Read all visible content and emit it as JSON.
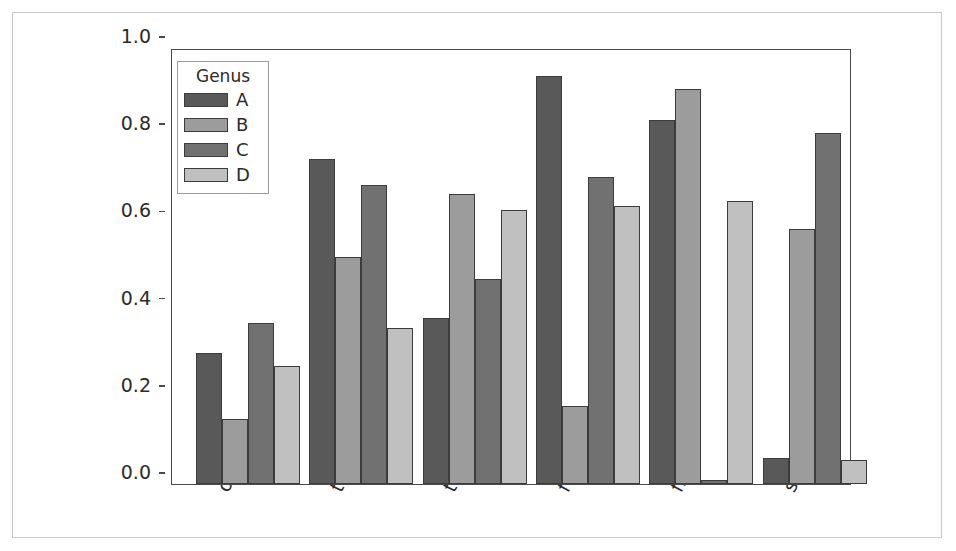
{
  "chart_data": {
    "type": "bar",
    "title": "",
    "xlabel": "",
    "ylabel": "",
    "categories": [
      "one",
      "two",
      "three",
      "four",
      "five",
      "six"
    ],
    "ylim": [
      0.0,
      1.0
    ],
    "yticks": [
      "0.0",
      "0.2",
      "0.4",
      "0.6",
      "0.8",
      "1.0"
    ],
    "ytick_values": [
      0.0,
      0.2,
      0.4,
      0.6,
      0.8,
      1.0
    ],
    "grid": false,
    "legend_title": "Genus",
    "legend_position": "upper-left-inside",
    "series": [
      {
        "name": "A",
        "color": "#595959",
        "values": [
          0.3,
          0.745,
          0.38,
          0.935,
          0.835,
          0.06
        ]
      },
      {
        "name": "B",
        "color": "#9c9c9c",
        "values": [
          0.15,
          0.52,
          0.665,
          0.18,
          0.905,
          0.585
        ]
      },
      {
        "name": "C",
        "color": "#717171",
        "values": [
          0.37,
          0.685,
          0.47,
          0.705,
          0.01,
          0.805
        ]
      },
      {
        "name": "D",
        "color": "#c0c0c0",
        "values": [
          0.27,
          0.358,
          0.628,
          0.637,
          0.648,
          0.055
        ]
      }
    ]
  },
  "figure": {
    "background_color": "#ffffff",
    "frame_color": "#c9c9c9",
    "axis_color": "#4a4a4a",
    "bar_edge_color": "#3c3c3c",
    "text_color": "#2b2b2b"
  }
}
